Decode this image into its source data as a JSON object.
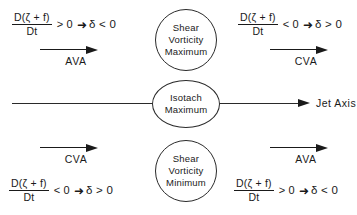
{
  "diagram": {
    "axis": {
      "label": "Jet Axis",
      "arrow_icon": "right-arrow-icon"
    },
    "bubbles": [
      {
        "id": "shear-vorticity-maximum",
        "line1": "Shear",
        "line2": "Vorticity",
        "line3": "Maximum"
      },
      {
        "id": "isotach-maximum",
        "line1": "Isotach",
        "line2": "Maximum"
      },
      {
        "id": "shear-vorticity-minimum",
        "line1": "Shear",
        "line2": "Vorticity",
        "line3": "Minimum"
      }
    ],
    "quadrants": [
      {
        "id": "upper-left",
        "equation": {
          "numerator": "D(ζ + f)",
          "denominator": "Dt",
          "relation": "> 0",
          "implies": "➜",
          "result": "δ < 0"
        },
        "advection": {
          "label": "AVA",
          "arrow_icon": "right-arrow-icon"
        }
      },
      {
        "id": "upper-right",
        "equation": {
          "numerator": "D(ζ + f)",
          "denominator": "Dt",
          "relation": "< 0",
          "implies": "➜",
          "result": "δ > 0"
        },
        "advection": {
          "label": "CVA",
          "arrow_icon": "right-arrow-icon"
        }
      },
      {
        "id": "lower-left",
        "equation": {
          "numerator": "D(ζ + f)",
          "denominator": "Dt",
          "relation": "< 0",
          "implies": "➜",
          "result": "δ > 0"
        },
        "advection": {
          "label": "CVA",
          "arrow_icon": "right-arrow-icon"
        }
      },
      {
        "id": "lower-right",
        "equation": {
          "numerator": "D(ζ + f)",
          "denominator": "Dt",
          "relation": "> 0",
          "implies": "➜",
          "result": "δ < 0"
        },
        "advection": {
          "label": "AVA",
          "arrow_icon": "right-arrow-icon"
        }
      }
    ],
    "colors": {
      "ink": "#1a1a1a",
      "line": "#2a2a2a",
      "background": "#ffffff"
    }
  }
}
